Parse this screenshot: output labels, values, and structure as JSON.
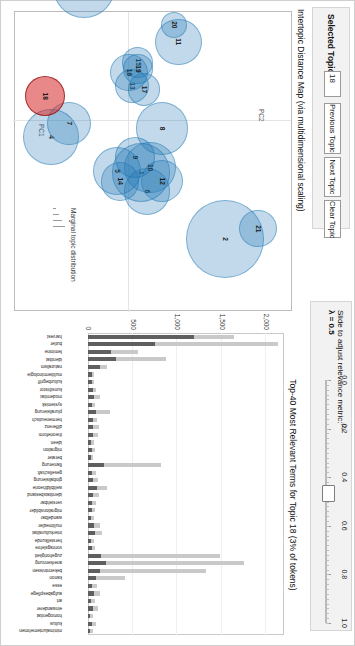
{
  "app": {
    "title": "LDAvis"
  },
  "controls": {
    "selected_topic_label": "Selected Topic:",
    "selected_topic_value": "18",
    "previous_topic_label": "Previous Topic",
    "next_topic_label": "Next Topic",
    "clear_topic_label": "Clear Topic",
    "slider_title": "Slide to adjust relevance metric:",
    "slider_superscript": "(2)",
    "lambda_label": "λ = 0.5",
    "lambda_value": 0.5,
    "slider_ticks": [
      "0.0",
      "0.2",
      "0.4",
      "0.6",
      "0.8",
      "1.0"
    ]
  },
  "map": {
    "title": "Intertopic Distance Map (via multidimensional scaling)",
    "x_axis_label": "PC1",
    "y_axis_label": "PC2",
    "legend_title": "Marginal topic distribution",
    "selected_topic": 18
  },
  "barchart_header": {
    "title": "Top-40 Most Relevant Terms for Topic 18 (3% of tokens)"
  },
  "chart_data": [
    {
      "type": "scatter",
      "title": "Intertopic Distance Map (via multidimensional scaling)",
      "xlabel": "PC1",
      "ylabel": "PC2",
      "grid": true,
      "legend": "Marginal topic distribution",
      "points": [
        {
          "topic": 1,
          "x": 0.31,
          "y": 0.08,
          "size": 38,
          "selected": false
        },
        {
          "topic": 2,
          "x": 0.7,
          "y": 0.64,
          "size": 50,
          "selected": false
        },
        {
          "topic": 3,
          "x": -0.78,
          "y": -0.3,
          "size": 40,
          "selected": false
        },
        {
          "topic": 4,
          "x": 0.1,
          "y": -0.52,
          "size": 36,
          "selected": false
        },
        {
          "topic": 5,
          "x": 0.3,
          "y": -0.08,
          "size": 31,
          "selected": false
        },
        {
          "topic": 6,
          "x": 0.42,
          "y": 0.12,
          "size": 30,
          "selected": false
        },
        {
          "topic": 7,
          "x": 0.02,
          "y": -0.4,
          "size": 28,
          "selected": false
        },
        {
          "topic": 8,
          "x": 0.05,
          "y": 0.22,
          "size": 34,
          "selected": false
        },
        {
          "topic": 9,
          "x": 0.22,
          "y": 0.04,
          "size": 26,
          "selected": false
        },
        {
          "topic": 10,
          "x": 0.28,
          "y": 0.14,
          "size": 33,
          "selected": false
        },
        {
          "topic": 11,
          "x": -0.46,
          "y": 0.33,
          "size": 30,
          "selected": false
        },
        {
          "topic": 12,
          "x": 0.36,
          "y": 0.22,
          "size": 27,
          "selected": false
        },
        {
          "topic": 13,
          "x": -0.2,
          "y": 0.02,
          "size": 22,
          "selected": false
        },
        {
          "topic": 14,
          "x": 0.36,
          "y": -0.06,
          "size": 25,
          "selected": false
        },
        {
          "topic": 15,
          "x": -0.34,
          "y": 0.06,
          "size": 20,
          "selected": false
        },
        {
          "topic": 16,
          "x": -0.28,
          "y": 0.0,
          "size": 24,
          "selected": false
        },
        {
          "topic": 17,
          "x": -0.18,
          "y": 0.1,
          "size": 21,
          "selected": false
        },
        {
          "topic": 18,
          "x": -0.14,
          "y": -0.56,
          "size": 26,
          "selected": true
        },
        {
          "topic": 19,
          "x": -0.3,
          "y": 0.06,
          "size": 19,
          "selected": false
        },
        {
          "topic": 20,
          "x": -0.56,
          "y": 0.3,
          "size": 17,
          "selected": false
        },
        {
          "topic": 21,
          "x": 0.64,
          "y": 0.86,
          "size": 24,
          "selected": false
        }
      ]
    },
    {
      "type": "bar",
      "title": "Top-40 Most Relevant Terms for Topic 18 (3% of tokens)",
      "xlabel": "",
      "ylabel": "",
      "ylim": [
        0,
        2200
      ],
      "yticks": [
        0,
        500,
        1000,
        1500,
        2000
      ],
      "ytick_labels": [
        "0",
        "500",
        "1,000",
        "1,500",
        "2,000"
      ],
      "grid": true,
      "legend": [
        "Overall term frequency",
        "Estimated term frequency within the selected topic"
      ],
      "colors": {
        "overall": "#c9c9c9",
        "topic": "#5f5f5f"
      },
      "categories": [
        "harvest",
        "butler",
        "feminine",
        "identitat",
        "naturalism",
        "multiterminologie",
        "kulturbegriff",
        "kunsthistor",
        "modernitat",
        "systemisk",
        "pluralisierung",
        "hermeneutisch",
        "differenz",
        "theorieform",
        "ideen",
        "migration",
        "berater",
        "flanierung",
        "gesellschaft",
        "globalisierung",
        "weltbildtheorie",
        "identitatsbestand",
        "verstehbar",
        "migrationsbilder",
        "wandelbar",
        "multimedier",
        "interkulturalitat",
        "herstellkunde",
        "vortragslehre",
        "zugehorigkeit",
        "anerkennung",
        "bekenntnissen",
        "kanon",
        "esse",
        "aufgabespflege",
        "art",
        "einwanderer",
        "homogenitat",
        "kultus",
        "minimalunternehmen"
      ],
      "series": [
        {
          "name": "Overall term frequency",
          "values": [
            1640,
            2130,
            560,
            880,
            215,
            70,
            70,
            95,
            130,
            80,
            250,
            100,
            120,
            110,
            70,
            80,
            60,
            820,
            90,
            110,
            210,
            120,
            95,
            80,
            65,
            130,
            160,
            65,
            75,
            1480,
            1750,
            1320,
            420,
            105,
            135,
            75,
            110,
            60,
            90,
            60
          ]
        },
        {
          "name": "Estimated term frequency within the selected topic",
          "values": [
            1190,
            750,
            260,
            320,
            130,
            40,
            40,
            55,
            70,
            45,
            90,
            55,
            60,
            55,
            35,
            45,
            30,
            175,
            45,
            55,
            100,
            60,
            50,
            40,
            30,
            70,
            80,
            30,
            40,
            150,
            200,
            130,
            90,
            50,
            70,
            35,
            55,
            25,
            45,
            25
          ]
        }
      ]
    }
  ]
}
